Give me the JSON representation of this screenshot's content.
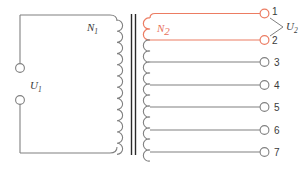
{
  "diagram": {
    "colors": {
      "wire": "#808080",
      "core": "#2b2b2b",
      "highlight": "#ec7c62",
      "text": "#3a3a3a",
      "background": "#ffffff"
    },
    "primary": {
      "winding_label": "N",
      "winding_label_sub": "1",
      "voltage_label": "U",
      "voltage_label_sub": "1",
      "terminal_count": 2
    },
    "secondary": {
      "winding_label": "N",
      "winding_label_sub": "2",
      "voltage_label": "U",
      "voltage_label_sub": "2",
      "highlighted_terminals": [
        "1",
        "2"
      ],
      "terminals": [
        {
          "number": "1",
          "y": 18,
          "highlighted": true
        },
        {
          "number": "2",
          "y": 40,
          "highlighted": true
        },
        {
          "number": "3",
          "y": 62,
          "highlighted": false
        },
        {
          "number": "4",
          "y": 85,
          "highlighted": false
        },
        {
          "number": "5",
          "y": 107,
          "highlighted": false
        },
        {
          "number": "6",
          "y": 130,
          "highlighted": false
        },
        {
          "number": "7",
          "y": 152,
          "highlighted": false
        }
      ]
    }
  }
}
